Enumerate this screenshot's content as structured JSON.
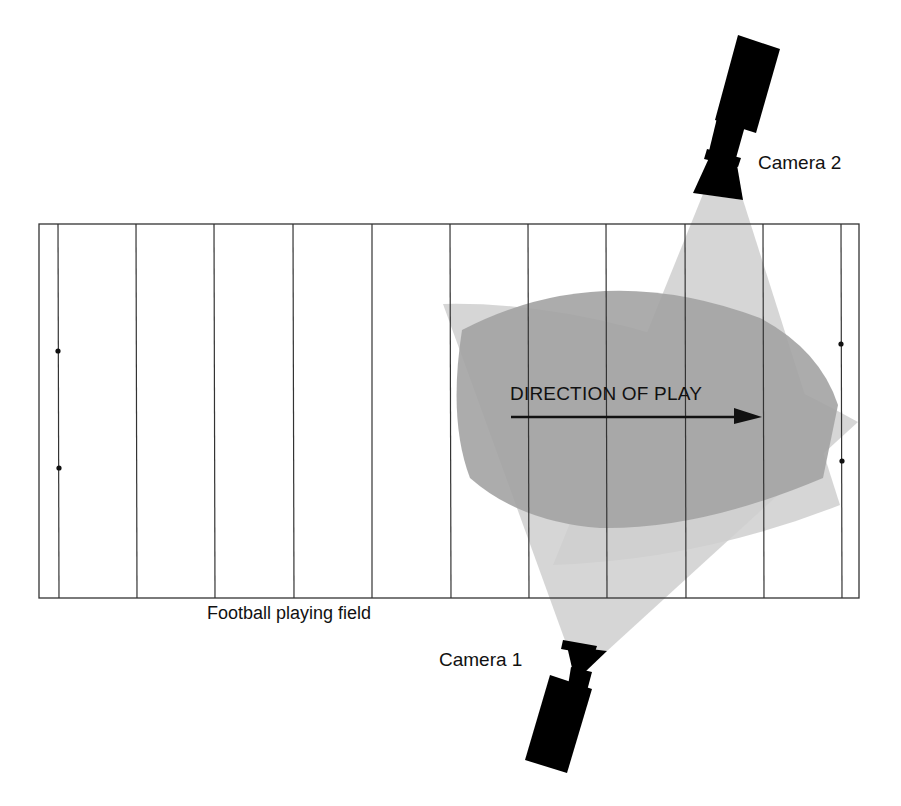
{
  "diagram": {
    "type": "camera coverage diagram",
    "labels": {
      "camera_1": "Camera 1",
      "camera_2": "Camera 2",
      "field": "Football playing field",
      "direction": "DIRECTION OF PLAY"
    },
    "colors": {
      "background": "#ffffff",
      "line": "#333333",
      "camera_body": "#000000",
      "beam": "#c9c9c9",
      "overlap": "#9a9a9a",
      "arrow": "#111111"
    },
    "field": {
      "x": 39,
      "y": 224,
      "width": 820,
      "height": 374,
      "yard_lines_x": [
        58,
        136,
        214,
        293,
        372,
        450,
        528,
        606,
        685,
        763,
        841
      ],
      "hash_dots": [
        {
          "x": 58,
          "y": 351
        },
        {
          "x": 59,
          "y": 468
        },
        {
          "x": 841,
          "y": 344
        },
        {
          "x": 842,
          "y": 461
        }
      ]
    },
    "cameras": [
      {
        "id": "camera_1",
        "label": "Camera 1",
        "position": "below field",
        "points": "up-right"
      },
      {
        "id": "camera_2",
        "label": "Camera 2",
        "position": "above field",
        "points": "down-left"
      }
    ],
    "arrow": {
      "x1": 511,
      "y1": 417,
      "x2": 762,
      "y2": 417
    }
  }
}
